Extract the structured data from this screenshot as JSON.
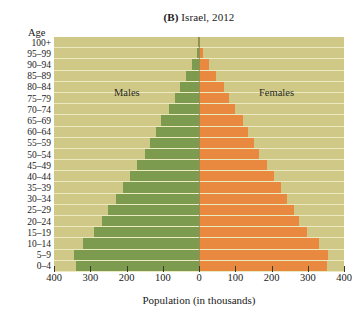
{
  "chart_data": {
    "type": "bar",
    "subtype": "population-pyramid",
    "title": "(B) Israel, 2012",
    "title_prefix": "(B)",
    "title_rest": " Israel, 2012",
    "xlabel": "Population (in thousands)",
    "ylabel": "Age",
    "xlim": [
      -400,
      400
    ],
    "xticks": [
      400,
      300,
      200,
      100,
      0,
      100,
      200,
      300,
      400
    ],
    "xtick_values": [
      -400,
      -300,
      -200,
      -100,
      0,
      100,
      200,
      300,
      400
    ],
    "grid": true,
    "legend_position": "in-plot",
    "categories": [
      "100+",
      "95–99",
      "90–94",
      "85–89",
      "80–84",
      "75–79",
      "70–74",
      "65–69",
      "60–64",
      "55–59",
      "50–54",
      "45–49",
      "40–44",
      "35–39",
      "30–34",
      "25–29",
      "20–24",
      "15–19",
      "10–14",
      "5–9",
      "0–4"
    ],
    "series": [
      {
        "name": "Males",
        "color": "#7d9b4e",
        "side": "left",
        "values": [
          2,
          6,
          18,
          36,
          52,
          66,
          82,
          104,
          120,
          136,
          150,
          172,
          190,
          210,
          228,
          252,
          268,
          290,
          320,
          345,
          340
        ]
      },
      {
        "name": "Females",
        "color": "#e8893f",
        "side": "right",
        "values": [
          4,
          10,
          28,
          48,
          68,
          82,
          98,
          120,
          136,
          152,
          166,
          188,
          206,
          226,
          242,
          262,
          276,
          298,
          330,
          355,
          352
        ]
      }
    ],
    "colors": {
      "male": "#7d9b4e",
      "female": "#e8893f",
      "plot_background": "#cfc886",
      "gridline": "#eceac0",
      "page_background": "#ffffff",
      "text": "#1a1a1a"
    }
  }
}
